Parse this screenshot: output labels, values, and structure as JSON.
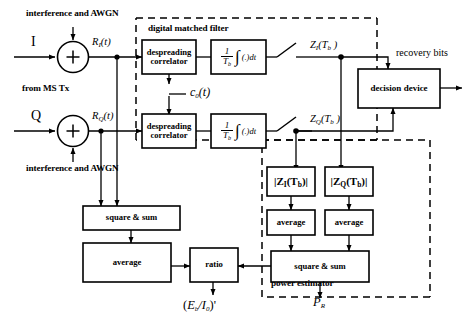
{
  "diagram": {
    "regions": {
      "digital_matched_filter": "digital matched filter",
      "power_estimator": "power estimator"
    },
    "inputs": {
      "i_branch": "I",
      "q_branch": "Q",
      "source_note": "from MS Tx",
      "noise_top": "interference and AWGN",
      "noise_bottom": "interference and AWGN"
    },
    "signals": {
      "r_i": {
        "base": "R",
        "sub": "I",
        "arg": "(t)"
      },
      "r_q": {
        "base": "R",
        "sub": "Q",
        "arg": "(t)"
      },
      "code": {
        "base": "c",
        "sub": "0",
        "arg": "(t)"
      },
      "z_i": {
        "base": "Z",
        "sub": "I",
        "arg": "(T",
        "argsub": "b",
        "argend": " )"
      },
      "z_q": {
        "base": "Z",
        "sub": "Q",
        "arg": "(T",
        "argsub": "b",
        "argend": " )"
      },
      "recovery_bits": "recovery bits",
      "ebi0": {
        "open": "(",
        "base": "E",
        "sub": "b",
        "slash": "/I",
        "sub2": "0",
        "close": ")",
        "prime": "'"
      },
      "pr": {
        "base": "P",
        "sub": "R"
      }
    },
    "blocks": {
      "despreading_i": "despreading correlator",
      "despreading_q": "despreading correlator",
      "integrator_i": {
        "num": "1",
        "den": "T b",
        "integral": "∫",
        "dt": "(.)dt"
      },
      "integrator_q": {
        "num": "1",
        "den": "T b",
        "integral": "∫",
        "dt": "(.)dt"
      },
      "decision_device": "decision device",
      "mag_i": "|Z I(T b)|",
      "mag_q": "|Z Q(T b)|",
      "average_i": "average",
      "average_q": "average",
      "square_sum_power": "square & sum",
      "square_sum_noise": "square & sum",
      "average_noise": "average",
      "ratio": "ratio"
    },
    "operators": {
      "sum_i": "+",
      "sum_q": "+"
    },
    "colors": {
      "line": "#000000",
      "background": "#ffffff",
      "dashed": "#000000"
    }
  }
}
